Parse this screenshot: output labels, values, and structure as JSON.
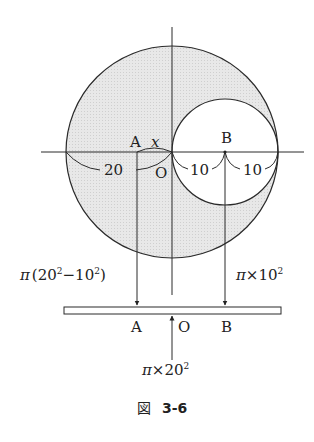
{
  "figure": {
    "caption_prefix": "図",
    "caption_number": "3-6",
    "colors": {
      "shade": "#e4e4e4",
      "stroke": "#2a2a2a",
      "background": "#ffffff"
    }
  },
  "diagram": {
    "large_circle": {
      "radius_label": "20",
      "center_label": "O"
    },
    "small_circle": {
      "radius_label": "10",
      "center_label": "B"
    },
    "point_A": {
      "label": "A",
      "offset_label": "x"
    },
    "dimensions": {
      "left": "20",
      "middle": "10",
      "right": "10"
    },
    "forces": {
      "A": {
        "base": "π",
        "expr": "(20",
        "sup1": "2",
        "minus": "−10",
        "sup2": "2",
        "close": ")"
      },
      "B": {
        "base": "π",
        "times": "×10",
        "sup": "2"
      },
      "O": {
        "base": "π",
        "times": "×20",
        "sup": "2"
      }
    },
    "beam_labels": {
      "A": "A",
      "O": "O",
      "B": "B"
    }
  }
}
